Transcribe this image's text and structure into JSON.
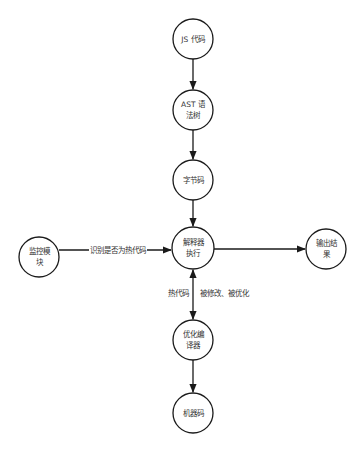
{
  "diagram": {
    "nodes": [
      {
        "id": "js",
        "lines": [
          "JS 代码"
        ],
        "cx": 193,
        "cy": 39,
        "r": 20
      },
      {
        "id": "ast",
        "lines": [
          "AST 语",
          "法树"
        ],
        "cx": 193,
        "cy": 110,
        "r": 20
      },
      {
        "id": "bytecode",
        "lines": [
          "字节码"
        ],
        "cx": 193,
        "cy": 180,
        "r": 20
      },
      {
        "id": "interpreter",
        "lines": [
          "解释器",
          "执行"
        ],
        "cx": 193,
        "cy": 248,
        "r": 21
      },
      {
        "id": "monitor",
        "lines": [
          "监控模",
          "块"
        ],
        "cx": 39,
        "cy": 257,
        "r": 20
      },
      {
        "id": "output",
        "lines": [
          "输出结",
          "果"
        ],
        "cx": 326,
        "cy": 249,
        "r": 20
      },
      {
        "id": "optimizer",
        "lines": [
          "优化编",
          "译器"
        ],
        "cx": 193,
        "cy": 340,
        "r": 20
      },
      {
        "id": "machine",
        "lines": [
          "机器码"
        ],
        "cx": 193,
        "cy": 413,
        "r": 20
      }
    ],
    "edges": [
      {
        "from": "js",
        "to": "ast",
        "label": ""
      },
      {
        "from": "ast",
        "to": "bytecode",
        "label": ""
      },
      {
        "from": "bytecode",
        "to": "interpreter",
        "label": ""
      },
      {
        "from": "monitor",
        "to": "interpreter",
        "label": "识别是否为热代码"
      },
      {
        "from": "interpreter",
        "to": "output",
        "label": ""
      },
      {
        "from": "interpreter",
        "to": "optimizer",
        "label": "热代码",
        "bidirectional": true
      },
      {
        "from": "optimizer",
        "to": "machine",
        "label": ""
      }
    ],
    "labels": {
      "js": "JS 代码",
      "ast_line1": "AST 语",
      "ast_line2": "法树",
      "bytecode": "字节码",
      "interpreter_line1": "解释器",
      "interpreter_line2": "执行",
      "monitor_line1": "监控模",
      "monitor_line2": "块",
      "output_line1": "输出结",
      "output_line2": "果",
      "optimizer_line1": "优化编",
      "optimizer_line2": "译器",
      "machine": "机器码",
      "edge_monitor_interpreter": "识别是否为热代码",
      "edge_hot_code": "热代码",
      "edge_deopt": "被修改、被优化"
    },
    "colors": {
      "stroke": "#1a1a1a",
      "text": "#333333",
      "background": "#ffffff"
    }
  }
}
